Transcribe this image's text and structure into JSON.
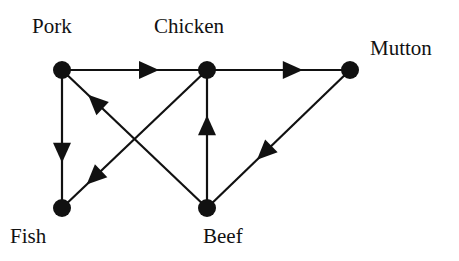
{
  "diagram": {
    "type": "directed-graph",
    "colors": {
      "stroke": "#111111",
      "background": "#ffffff"
    },
    "nodes": [
      {
        "id": "pork",
        "label": "Pork",
        "x": 62,
        "y": 70,
        "label_x": 32,
        "label_y": 33
      },
      {
        "id": "chicken",
        "label": "Chicken",
        "x": 207,
        "y": 70,
        "label_x": 154,
        "label_y": 33
      },
      {
        "id": "mutton",
        "label": "Mutton",
        "x": 350,
        "y": 70,
        "label_x": 370,
        "label_y": 55
      },
      {
        "id": "fish",
        "label": "Fish",
        "x": 62,
        "y": 208,
        "label_x": 10,
        "label_y": 243
      },
      {
        "id": "beef",
        "label": "Beef",
        "x": 207,
        "y": 208,
        "label_x": 203,
        "label_y": 243
      }
    ],
    "edges": [
      {
        "from": "pork",
        "to": "chicken",
        "arrow_t": 0.6
      },
      {
        "from": "chicken",
        "to": "mutton",
        "arrow_t": 0.6
      },
      {
        "from": "pork",
        "to": "fish",
        "arrow_t": 0.6
      },
      {
        "from": "chicken",
        "to": "fish",
        "arrow_t": 0.78
      },
      {
        "from": "beef",
        "to": "pork",
        "arrow_t": 0.77
      },
      {
        "from": "beef",
        "to": "chicken",
        "arrow_t": 0.6
      },
      {
        "from": "mutton",
        "to": "beef",
        "arrow_t": 0.6
      }
    ]
  }
}
